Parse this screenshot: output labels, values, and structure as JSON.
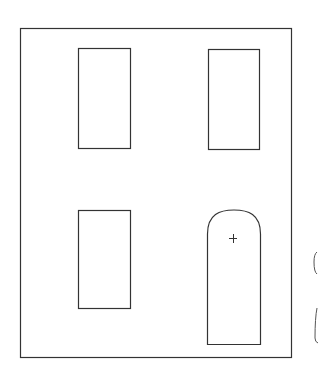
{
  "drawing": {
    "width": 319,
    "height": 372,
    "stroke_color": "#333333",
    "background": "#ffffff",
    "facade": {
      "x": 20,
      "y": 28,
      "w": 271,
      "h": 329
    },
    "windows": [
      {
        "name": "window-top-left",
        "x": 78,
        "y": 48,
        "w": 52,
        "h": 100
      },
      {
        "name": "window-top-right",
        "x": 208,
        "y": 49,
        "w": 51,
        "h": 100
      },
      {
        "name": "window-bottom-left",
        "x": 78,
        "y": 210,
        "w": 52,
        "h": 98
      }
    ],
    "door": {
      "x": 207,
      "y_arch_top": 210,
      "y_arch_start": 234,
      "w": 53,
      "y_bottom": 344
    },
    "door_cursor_mark": {
      "x": 233,
      "y": 238,
      "glyph": "+"
    }
  }
}
